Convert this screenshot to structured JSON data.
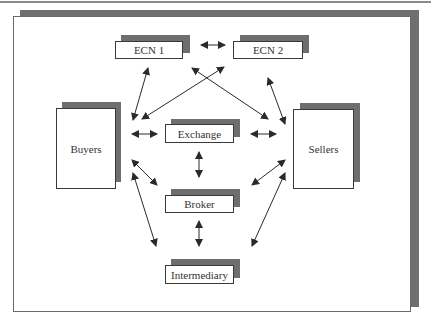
{
  "diagram": {
    "nodes": {
      "ecn1": {
        "label": "ECN 1"
      },
      "ecn2": {
        "label": "ECN 2"
      },
      "buyers": {
        "label": "Buyers"
      },
      "sellers": {
        "label": "Sellers"
      },
      "exchange": {
        "label": "Exchange"
      },
      "broker": {
        "label": "Broker"
      },
      "intermediary": {
        "label": "Intermediary"
      }
    },
    "edges": [
      {
        "from": "ECN 1",
        "to": "ECN 2",
        "type": "bidirectional"
      },
      {
        "from": "Buyers",
        "to": "ECN 1",
        "type": "bidirectional"
      },
      {
        "from": "Buyers",
        "to": "ECN 2",
        "type": "bidirectional"
      },
      {
        "from": "Sellers",
        "to": "ECN 1",
        "type": "bidirectional"
      },
      {
        "from": "Sellers",
        "to": "ECN 2",
        "type": "bidirectional"
      },
      {
        "from": "Buyers",
        "to": "Exchange",
        "type": "bidirectional"
      },
      {
        "from": "Exchange",
        "to": "Sellers",
        "type": "bidirectional"
      },
      {
        "from": "Exchange",
        "to": "Broker",
        "type": "bidirectional"
      },
      {
        "from": "Buyers",
        "to": "Broker",
        "type": "bidirectional"
      },
      {
        "from": "Sellers",
        "to": "Broker",
        "type": "bidirectional"
      },
      {
        "from": "Broker",
        "to": "Intermediary",
        "type": "bidirectional"
      },
      {
        "from": "Buyers",
        "to": "Intermediary",
        "type": "bidirectional"
      },
      {
        "from": "Sellers",
        "to": "Intermediary",
        "type": "bidirectional"
      }
    ],
    "colors": {
      "shadow": "#6e6e6e",
      "border": "#3a3a3a",
      "arrow": "#2a2a2a"
    }
  }
}
